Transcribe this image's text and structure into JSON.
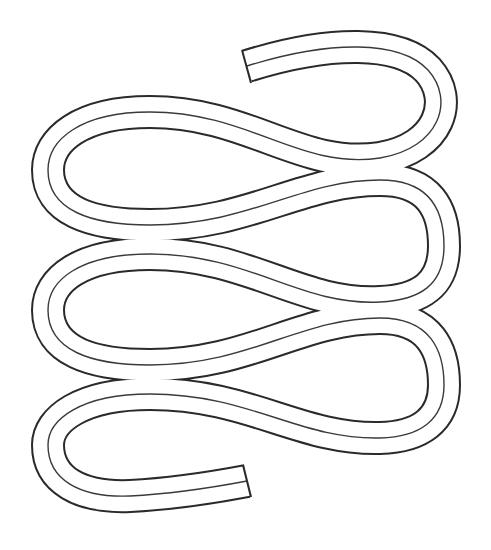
{
  "illustration": {
    "subject": "serpentine tube line drawing",
    "description": "A continuous flat double-walled tube bent back and forth in a zig-zag serpentine shape with a center line, cut squarely at both ends",
    "colors": {
      "background": "#ffffff",
      "stroke": "#2a2a2a",
      "fill": "#ffffff"
    },
    "tube_width_px": 32,
    "loops": 6,
    "ends": {
      "start": {
        "label": "top cut end",
        "x": 247,
        "y": 66
      },
      "finish": {
        "label": "bottom cut end",
        "x": 247,
        "y": 481
      }
    }
  }
}
